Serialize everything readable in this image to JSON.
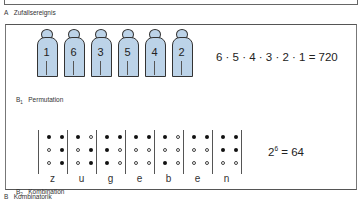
{
  "sectionA": {
    "label": "A",
    "title": "Zufallsereignis"
  },
  "sectionB": {
    "label": "B",
    "title": "Kombinatorik",
    "b1": {
      "label": "B",
      "sub": "1",
      "title": "Permutation",
      "figure_numbers": [
        "1",
        "6",
        "3",
        "5",
        "4",
        "2"
      ],
      "figure_color": "#bcd3e8",
      "formula": "6 · 5 · 4 · 3 · 2 · 1 = 720"
    },
    "b2": {
      "label": "B",
      "sub": "2",
      "title": "Kombination",
      "cells": [
        {
          "letter": "z",
          "dots": [
            "f",
            "o",
            "o",
            "f",
            "f",
            "f"
          ]
        },
        {
          "letter": "u",
          "dots": [
            "f",
            "o",
            "o",
            "o",
            "f",
            "f"
          ]
        },
        {
          "letter": "g",
          "dots": [
            "f",
            "f",
            "f",
            "f",
            "o",
            "o"
          ]
        },
        {
          "letter": "e",
          "dots": [
            "f",
            "o",
            "o",
            "f",
            "o",
            "o"
          ]
        },
        {
          "letter": "b",
          "dots": [
            "f",
            "o",
            "f",
            "o",
            "o",
            "o"
          ]
        },
        {
          "letter": "e",
          "dots": [
            "f",
            "o",
            "o",
            "f",
            "o",
            "o"
          ]
        },
        {
          "letter": "n",
          "dots": [
            "f",
            "f",
            "o",
            "f",
            "f",
            "o"
          ]
        }
      ],
      "formula_base": "2",
      "formula_exp": "6",
      "formula_rest": " = 64"
    }
  }
}
